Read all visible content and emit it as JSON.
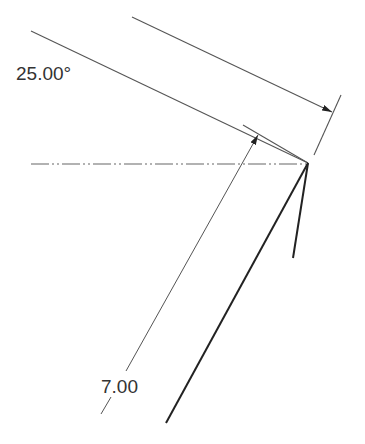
{
  "diagram": {
    "type": "engineering-drawing",
    "labels": {
      "angle_dimension": "25.00°",
      "length_dimension": "7.00"
    },
    "colors": {
      "background": "#ffffff",
      "thin_line": "#555555",
      "thick_line": "#222222",
      "text": "#333333"
    }
  }
}
